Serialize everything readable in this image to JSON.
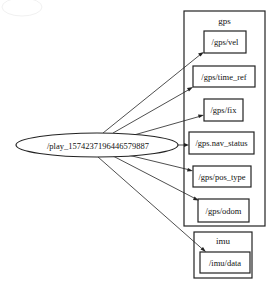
{
  "graph": {
    "source_node": {
      "label": "/play_1574237196446579887",
      "shape": "ellipse",
      "cx": 97,
      "cy": 145,
      "rx": 81,
      "ry": 12
    },
    "clusters": [
      {
        "name": "gps",
        "label": "gps",
        "x": 184,
        "y": 11,
        "w": 81,
        "h": 215,
        "topics": [
          {
            "label": "/gps/vel",
            "x": 204,
            "y": 31,
            "w": 42,
            "h": 22
          },
          {
            "label": "/gps/time_ref",
            "x": 193,
            "y": 66,
            "w": 62,
            "h": 21
          },
          {
            "label": "/gps/fix",
            "x": 204,
            "y": 99,
            "w": 39,
            "h": 22
          },
          {
            "label": "/gps.nav_status",
            "x": 189,
            "y": 132,
            "w": 65,
            "h": 22
          },
          {
            "label": "/gps/pos_type",
            "x": 193,
            "y": 166,
            "w": 58,
            "h": 21
          },
          {
            "label": "/gps/odom",
            "x": 198,
            "y": 199,
            "w": 51,
            "h": 23
          }
        ]
      },
      {
        "name": "imu",
        "label": "imu",
        "x": 194,
        "y": 232,
        "w": 58,
        "h": 46,
        "topics": [
          {
            "label": "/imu/data",
            "x": 200,
            "y": 252,
            "w": 50,
            "h": 21
          }
        ]
      }
    ],
    "edges": [
      {
        "from": "/play_1574237196446579887",
        "to": "/gps/vel",
        "x1": 103,
        "y1": 133,
        "x2": 204,
        "y2": 52
      },
      {
        "from": "/play_1574237196446579887",
        "to": "/gps/time_ref",
        "x1": 113,
        "y1": 133,
        "x2": 193,
        "y2": 87
      },
      {
        "from": "/play_1574237196446579887",
        "to": "/gps/fix",
        "x1": 134,
        "y1": 135,
        "x2": 204,
        "y2": 115
      },
      {
        "from": "/play_1574237196446579887",
        "to": "/gps.nav_status",
        "x1": 178,
        "y1": 145,
        "x2": 189,
        "y2": 145
      },
      {
        "from": "/play_1574237196446579887",
        "to": "/gps/pos_type",
        "x1": 128,
        "y1": 155,
        "x2": 193,
        "y2": 171
      },
      {
        "from": "/play_1574237196446579887",
        "to": "/gps/odom",
        "x1": 113,
        "y1": 156,
        "x2": 199,
        "y2": 200
      },
      {
        "from": "/play_1574237196446579887",
        "to": "/imu/data",
        "x1": 98,
        "y1": 157,
        "x2": 206,
        "y2": 252
      }
    ]
  }
}
